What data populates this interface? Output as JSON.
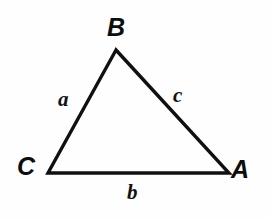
{
  "figure": {
    "type": "geometry-diagram",
    "shape": "triangle",
    "background_color": "#fefefe",
    "stroke_color": "#101010",
    "text_color": "#0d0d0d"
  },
  "vertices": [
    {
      "id": "B",
      "label": "B",
      "x": 116,
      "y": 50,
      "label_x": 117,
      "label_y": 28
    },
    {
      "id": "C",
      "label": "C",
      "x": 48,
      "y": 173,
      "label_x": 28,
      "label_y": 169
    },
    {
      "id": "A",
      "label": "A",
      "x": 229,
      "y": 173,
      "label_x": 243,
      "label_y": 172
    }
  ],
  "sides": [
    {
      "id": "a",
      "label": "a",
      "from": "C",
      "to": "B",
      "label_x": 67,
      "label_y": 101
    },
    {
      "id": "b",
      "label": "b",
      "from": "C",
      "to": "A",
      "label_x": 135,
      "label_y": 194
    },
    {
      "id": "c",
      "label": "c",
      "from": "B",
      "to": "A",
      "label_x": 182,
      "label_y": 97
    }
  ],
  "geometry": {
    "path": "M 116 50 L 48 173 L 229 173 Z",
    "stroke_width": 3.4
  }
}
